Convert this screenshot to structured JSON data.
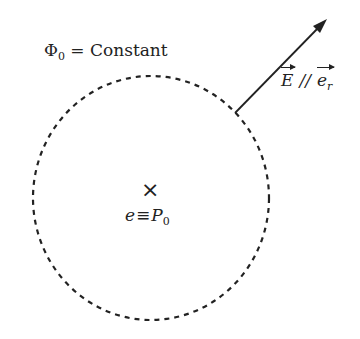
{
  "diagram": {
    "equipotential_label": {
      "symbol": "Φ",
      "subscript": "0",
      "relation": " = Constant"
    },
    "center_marker": {
      "glyph": "×",
      "icon": "cross-icon"
    },
    "center_label": {
      "lhs": "e",
      "relation": "≡",
      "rhs": "P",
      "subscript": "0"
    },
    "field_label": {
      "vector1": "E",
      "relation": "//",
      "vector2": "e",
      "vector2_subscript": "r"
    },
    "circle": {
      "cx": 151,
      "cy": 198,
      "rx": 118,
      "ry": 122,
      "style": "dashed",
      "color": "#222222"
    },
    "arrow": {
      "x1": 235,
      "y1": 113,
      "x2": 326,
      "y2": 20,
      "color": "#222222"
    }
  }
}
